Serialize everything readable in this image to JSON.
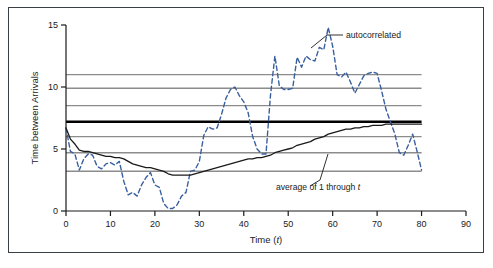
{
  "figure": {
    "background_color": "#ffffff",
    "border_color": "#3a3f45"
  },
  "chart_data": {
    "type": "line",
    "title": "",
    "xlabel": "Time (t)",
    "ylabel": "Time between Arrivals",
    "xlim": [
      0,
      90
    ],
    "ylim": [
      0,
      15
    ],
    "xticks": [
      0,
      10,
      20,
      30,
      40,
      50,
      60,
      70,
      80,
      90
    ],
    "xtick_labels": [
      "0",
      "10",
      "20",
      "30",
      "40",
      "50",
      "60",
      "70",
      "80",
      "90"
    ],
    "yticks": [
      0,
      5,
      10,
      15
    ],
    "ytick_labels": [
      "0",
      "5",
      "10",
      "15"
    ],
    "grid": false,
    "legend": "annotations",
    "reference_lines": [
      {
        "name": "ref-11.0",
        "value": 11.0,
        "color": "#8c8c8c",
        "width": 1.4,
        "bold": false
      },
      {
        "name": "ref-9.9",
        "value": 9.9,
        "color": "#8c8c8c",
        "width": 1.4,
        "bold": false
      },
      {
        "name": "ref-8.5",
        "value": 8.5,
        "color": "#8c8c8c",
        "width": 1.4,
        "bold": false
      },
      {
        "name": "mean-7.2",
        "value": 7.2,
        "color": "#000000",
        "width": 2.4,
        "bold": true
      },
      {
        "name": "ref-6.0",
        "value": 6.0,
        "color": "#8c8c8c",
        "width": 1.4,
        "bold": false
      },
      {
        "name": "ref-4.7",
        "value": 4.7,
        "color": "#8c8c8c",
        "width": 1.4,
        "bold": false
      },
      {
        "name": "ref-3.2",
        "value": 3.2,
        "color": "#8c8c8c",
        "width": 1.4,
        "bold": false
      }
    ],
    "reference_line_xrange": [
      0,
      80
    ],
    "series": [
      {
        "name": "autocorrelated",
        "label": "autocorrelated",
        "color": "#3a5f9e",
        "style": "dashed",
        "width": 1.4,
        "x": [
          0,
          1,
          2,
          3,
          4,
          5,
          6,
          7,
          8,
          9,
          10,
          11,
          12,
          13,
          14,
          15,
          16,
          17,
          18,
          19,
          20,
          21,
          22,
          23,
          24,
          25,
          26,
          27,
          28,
          29,
          30,
          31,
          32,
          33,
          34,
          35,
          36,
          37,
          38,
          39,
          40,
          41,
          42,
          43,
          44,
          45,
          46,
          47,
          48,
          49,
          50,
          51,
          52,
          53,
          54,
          55,
          56,
          57,
          58,
          59,
          60,
          61,
          62,
          63,
          64,
          65,
          66,
          67,
          68,
          69,
          70,
          71,
          72,
          73,
          74,
          75,
          76,
          77,
          78,
          79,
          80
        ],
        "y": [
          6.7,
          4.8,
          4.6,
          3.3,
          4.2,
          4.6,
          4.5,
          3.6,
          3.4,
          3.8,
          3.9,
          3.7,
          4.0,
          2.4,
          1.3,
          1.5,
          1.2,
          2.1,
          2.7,
          3.1,
          2.1,
          1.9,
          0.6,
          0.2,
          0.2,
          0.5,
          1.2,
          1.5,
          3.2,
          3.3,
          4.0,
          6.1,
          6.8,
          6.6,
          6.7,
          7.8,
          9.1,
          9.8,
          10.0,
          9.3,
          8.8,
          7.9,
          6.0,
          5.0,
          4.6,
          4.6,
          9.3,
          12.5,
          10.1,
          9.8,
          9.8,
          9.9,
          12.4,
          11.6,
          12.5,
          12.2,
          12.1,
          13.2,
          13.0,
          14.8,
          13.3,
          11.0,
          10.8,
          11.2,
          10.4,
          9.5,
          10.2,
          10.9,
          11.1,
          11.2,
          11.1,
          9.7,
          8.2,
          7.2,
          6.2,
          4.7,
          4.5,
          5.3,
          6.2,
          4.8,
          3.3
        ]
      },
      {
        "name": "running-average",
        "label": "average of 1 through t",
        "color": "#1a1a1a",
        "style": "solid",
        "width": 1.3,
        "x": [
          0,
          1,
          2,
          3,
          4,
          5,
          6,
          7,
          8,
          9,
          10,
          11,
          12,
          13,
          14,
          15,
          16,
          17,
          18,
          19,
          20,
          21,
          22,
          23,
          24,
          25,
          26,
          27,
          28,
          29,
          30,
          31,
          32,
          33,
          34,
          35,
          36,
          37,
          38,
          39,
          40,
          41,
          42,
          43,
          44,
          45,
          46,
          47,
          48,
          49,
          50,
          51,
          52,
          53,
          54,
          55,
          56,
          57,
          58,
          59,
          60,
          61,
          62,
          63,
          64,
          65,
          66,
          67,
          68,
          69,
          70,
          71,
          72,
          73,
          74,
          75,
          76,
          77,
          78,
          79,
          80
        ],
        "y": [
          6.7,
          5.8,
          5.4,
          4.9,
          4.8,
          4.8,
          4.7,
          4.6,
          4.5,
          4.4,
          4.4,
          4.3,
          4.3,
          4.2,
          4.0,
          3.8,
          3.7,
          3.6,
          3.5,
          3.5,
          3.4,
          3.3,
          3.2,
          3.0,
          2.9,
          2.9,
          2.9,
          2.9,
          2.9,
          3.0,
          3.1,
          3.2,
          3.3,
          3.4,
          3.5,
          3.6,
          3.7,
          3.8,
          3.9,
          4.0,
          4.1,
          4.2,
          4.2,
          4.3,
          4.3,
          4.4,
          4.5,
          4.7,
          4.8,
          4.9,
          5.0,
          5.1,
          5.3,
          5.4,
          5.5,
          5.6,
          5.8,
          5.9,
          6.0,
          6.2,
          6.3,
          6.4,
          6.5,
          6.6,
          6.6,
          6.7,
          6.7,
          6.8,
          6.8,
          6.9,
          6.9,
          6.9,
          7.0,
          7.0,
          7.0,
          7.0,
          7.0,
          7.0,
          7.0,
          7.0,
          7.0
        ]
      }
    ],
    "annotations": [
      {
        "name": "autocorrelated-annotation",
        "text": "autocorrelated",
        "text_x": 346,
        "text_y": 38,
        "leader": [
          [
            343,
            35
          ],
          [
            327,
            35
          ],
          [
            311,
            48
          ]
        ]
      },
      {
        "name": "average-annotation",
        "text_parts": [
          "average of 1 through ",
          "t"
        ],
        "text": "average of 1 through t",
        "text_x": 276,
        "text_y": 190,
        "leader": [
          [
            310,
            186
          ],
          [
            320,
            180
          ],
          [
            328,
            154
          ]
        ]
      }
    ]
  }
}
